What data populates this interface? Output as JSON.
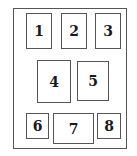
{
  "diagram": {
    "boxes": [
      {
        "label": "1"
      },
      {
        "label": "2"
      },
      {
        "label": "3"
      },
      {
        "label": "4"
      },
      {
        "label": "5"
      },
      {
        "label": "6"
      },
      {
        "label": "7"
      },
      {
        "label": "8"
      }
    ]
  }
}
